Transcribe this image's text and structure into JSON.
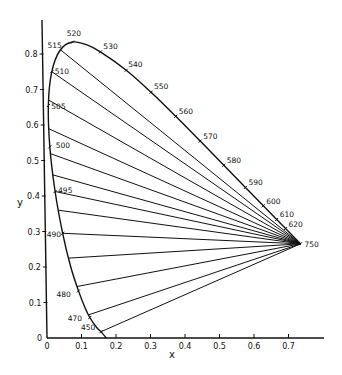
{
  "chart_data": {
    "type": "line",
    "title": "",
    "subtitle": "",
    "xlabel": "x",
    "ylabel": "y",
    "xlim": [
      0,
      0.8
    ],
    "ylim": [
      0,
      0.85
    ],
    "grid": false,
    "legend": null,
    "x_ticks": [
      0,
      0.1,
      0.2,
      0.3,
      0.4,
      0.5,
      0.6,
      0.7
    ],
    "x_tick_labels": [
      "0",
      "0.1",
      "0.2",
      "0.3",
      "0.4",
      "0.5",
      "0.6",
      "0.7"
    ],
    "y_ticks": [
      0,
      0.1,
      0.2,
      0.3,
      0.4,
      0.5,
      0.6,
      0.7,
      0.8
    ],
    "y_tick_labels": [
      "0",
      "0.1",
      "0.2",
      "0.3",
      "0.4",
      "0.5",
      "0.6",
      "0.7",
      "0.8"
    ],
    "spectral_locus": [
      {
        "wavelength": 450,
        "x": 0.1566,
        "y": 0.0177,
        "label": "450"
      },
      {
        "wavelength": 460,
        "x": 0.144,
        "y": 0.0297,
        "label": ""
      },
      {
        "wavelength": 470,
        "x": 0.1241,
        "y": 0.0578,
        "label": "470"
      },
      {
        "wavelength": 475,
        "x": 0.1096,
        "y": 0.0868,
        "label": ""
      },
      {
        "wavelength": 480,
        "x": 0.0913,
        "y": 0.1327,
        "label": "480"
      },
      {
        "wavelength": 485,
        "x": 0.0687,
        "y": 0.2007,
        "label": ""
      },
      {
        "wavelength": 490,
        "x": 0.0454,
        "y": 0.295,
        "label": "490"
      },
      {
        "wavelength": 495,
        "x": 0.0235,
        "y": 0.4127,
        "label": "495"
      },
      {
        "wavelength": 500,
        "x": 0.0082,
        "y": 0.5384,
        "label": "500"
      },
      {
        "wavelength": 505,
        "x": 0.0039,
        "y": 0.6548,
        "label": "505"
      },
      {
        "wavelength": 510,
        "x": 0.0139,
        "y": 0.7502,
        "label": "510"
      },
      {
        "wavelength": 515,
        "x": 0.0389,
        "y": 0.812,
        "label": "515"
      },
      {
        "wavelength": 520,
        "x": 0.0743,
        "y": 0.8338,
        "label": "520"
      },
      {
        "wavelength": 525,
        "x": 0.1142,
        "y": 0.8262,
        "label": ""
      },
      {
        "wavelength": 530,
        "x": 0.1547,
        "y": 0.8059,
        "label": "530"
      },
      {
        "wavelength": 540,
        "x": 0.2296,
        "y": 0.7543,
        "label": "540"
      },
      {
        "wavelength": 550,
        "x": 0.3016,
        "y": 0.6923,
        "label": "550"
      },
      {
        "wavelength": 560,
        "x": 0.3731,
        "y": 0.6245,
        "label": "560"
      },
      {
        "wavelength": 570,
        "x": 0.4441,
        "y": 0.5547,
        "label": "570"
      },
      {
        "wavelength": 580,
        "x": 0.5125,
        "y": 0.4866,
        "label": "580"
      },
      {
        "wavelength": 590,
        "x": 0.5752,
        "y": 0.4242,
        "label": "590"
      },
      {
        "wavelength": 600,
        "x": 0.627,
        "y": 0.3725,
        "label": "600"
      },
      {
        "wavelength": 610,
        "x": 0.6658,
        "y": 0.334,
        "label": "610"
      },
      {
        "wavelength": 620,
        "x": 0.6915,
        "y": 0.3083,
        "label": "620"
      },
      {
        "wavelength": 750,
        "x": 0.7347,
        "y": 0.2653,
        "label": "750"
      }
    ],
    "convergence_point": {
      "label": "750",
      "x": 0.7347,
      "y": 0.2653
    },
    "fan_lines_from": [
      {
        "x": 0.0389,
        "y": 0.812
      },
      {
        "x": 0.0139,
        "y": 0.7502
      },
      {
        "x": 0.005,
        "y": 0.67
      },
      {
        "x": 0.004,
        "y": 0.59
      },
      {
        "x": 0.0082,
        "y": 0.52
      },
      {
        "x": 0.015,
        "y": 0.46
      },
      {
        "x": 0.0235,
        "y": 0.4127
      },
      {
        "x": 0.033,
        "y": 0.36
      },
      {
        "x": 0.0454,
        "y": 0.295
      },
      {
        "x": 0.062,
        "y": 0.225
      },
      {
        "x": 0.087,
        "y": 0.145
      },
      {
        "x": 0.12,
        "y": 0.065
      },
      {
        "x": 0.1566,
        "y": 0.0177
      }
    ],
    "annotations": []
  }
}
